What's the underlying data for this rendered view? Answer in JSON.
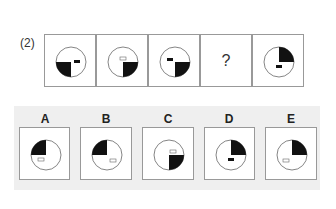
{
  "question": {
    "label": "(2)",
    "sequence": [
      {
        "id": "1",
        "filled_quadrant": "bottom-left",
        "marker": "filled",
        "marker_pos": "right"
      },
      {
        "id": "2",
        "filled_quadrant": "bottom-right",
        "marker": "hollow",
        "marker_pos": "top"
      },
      {
        "id": "3",
        "filled_quadrant": "bottom-right",
        "marker": "filled",
        "marker_pos": "top-left"
      },
      {
        "id": "4",
        "unknown": "?"
      },
      {
        "id": "5",
        "filled_quadrant": "top-right",
        "marker": "filled",
        "marker_pos": "bottom"
      }
    ]
  },
  "options": [
    {
      "letter": "A",
      "filled_quadrant": "top-left",
      "marker": "hollow",
      "marker_pos": "bottom"
    },
    {
      "letter": "B",
      "filled_quadrant": "top-left",
      "marker": "hollow",
      "marker_pos": "bottom-right"
    },
    {
      "letter": "C",
      "filled_quadrant": "bottom-right",
      "marker": "hollow",
      "marker_pos": "top"
    },
    {
      "letter": "D",
      "filled_quadrant": "top-right",
      "marker": "filled",
      "marker_pos": "bottom"
    },
    {
      "letter": "E",
      "filled_quadrant": "top-right",
      "marker": "hollow",
      "marker_pos": "left"
    }
  ]
}
